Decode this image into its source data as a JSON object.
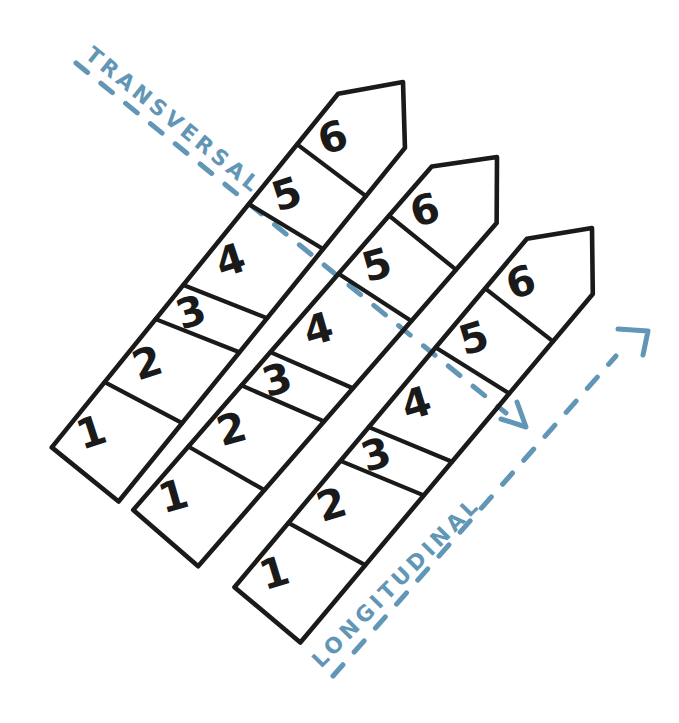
{
  "diagram": {
    "background": "#ffffff",
    "ink": "#1a1a1a",
    "accent": "#6196b6",
    "axes": {
      "transversal": {
        "label": "TRANSVERSAL",
        "direction": "down-right"
      },
      "longitudinal": {
        "label": "LONGITUDINAL",
        "direction": "up-right"
      }
    },
    "strips": [
      {
        "id": "strip-1",
        "segments": [
          "1",
          "2",
          "3",
          "4",
          "5",
          "6"
        ]
      },
      {
        "id": "strip-2",
        "segments": [
          "1",
          "2",
          "3",
          "4",
          "5",
          "6"
        ]
      },
      {
        "id": "strip-3",
        "segments": [
          "1",
          "2",
          "3",
          "4",
          "5",
          "6"
        ]
      }
    ]
  }
}
